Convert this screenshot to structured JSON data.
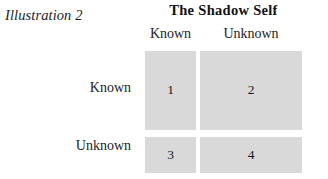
{
  "figure": {
    "caption": "Illustration 2",
    "title": "The Shadow Self",
    "colors": {
      "cell_fill": "#d9d9d9",
      "background": "#ffffff",
      "text": "#1a1a1a"
    }
  },
  "matrix": {
    "column_headers": [
      "Known",
      "Unknown"
    ],
    "row_labels": [
      "Known",
      "Unknown"
    ],
    "cells": [
      {
        "id": "q1",
        "row": "Known",
        "column": "Known",
        "value": "1"
      },
      {
        "id": "q2",
        "row": "Known",
        "column": "Unknown",
        "value": "2"
      },
      {
        "id": "q3",
        "row": "Unknown",
        "column": "Known",
        "value": "3"
      },
      {
        "id": "q4",
        "row": "Unknown",
        "column": "Unknown",
        "value": "4"
      }
    ]
  }
}
